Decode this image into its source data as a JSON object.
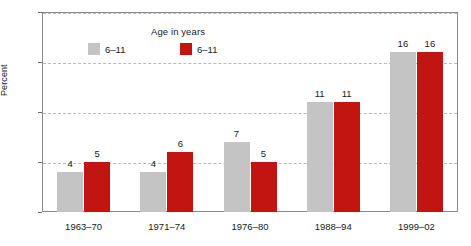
{
  "chart_data": {
    "type": "bar",
    "title": "",
    "xlabel": "",
    "ylabel": "Percent",
    "ylim": [
      0,
      20
    ],
    "yticks": [
      0,
      5,
      10,
      15,
      20
    ],
    "grid": "horizontal-dashed",
    "legend_position": "inside-top-left",
    "legend_title": "Age in years",
    "categories": [
      "1963–70",
      "1971–74",
      "1976–80",
      "1988–94",
      "1999–02"
    ],
    "series": [
      {
        "name": "6–11",
        "color": "#c4c4c4",
        "values": [
          4,
          4,
          7,
          11,
          16
        ]
      },
      {
        "name": "6–11",
        "color": "#c21410",
        "values": [
          5,
          6,
          5,
          11,
          16
        ]
      }
    ]
  },
  "axis": {
    "y_tick_labels": [
      "20",
      "15",
      "10",
      "5",
      "0"
    ],
    "y_label": "Percent"
  },
  "legend": {
    "title": "Age in years",
    "items": [
      {
        "label": "6–11",
        "color": "#c4c4c4"
      },
      {
        "label": "6–11",
        "color": "#c21410"
      }
    ]
  },
  "colors": {
    "series_gray": "#c4c4c4",
    "series_red": "#c21410",
    "gridline": "#b9b9b9",
    "frame": "#8a8a8a",
    "text": "#1a1a1a",
    "background": "#ffffff"
  }
}
